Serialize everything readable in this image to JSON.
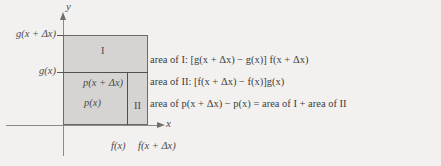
{
  "figure": {
    "background_color": "#f3f1ef",
    "shade_color": "#d6d4d2",
    "line_color": "#6b6b6b"
  },
  "axes": {
    "y_label": "y",
    "x_label": "x"
  },
  "y_ticks": [
    {
      "label": "g(x + Δx)",
      "name": "y-tick-g-x-plus-dx"
    },
    {
      "label": "g(x)",
      "name": "y-tick-g-x"
    }
  ],
  "x_ticks": [
    {
      "label": "f(x)",
      "name": "x-tick-f-x"
    },
    {
      "label": "f(x + Δx)",
      "name": "x-tick-f-x-plus-dx"
    }
  ],
  "regions": {
    "region_one": "I",
    "region_two": "II",
    "p_x_plus_dx": "p(x + Δx)",
    "p_x": "p(x)"
  },
  "equations": [
    {
      "name": "equation-area-of-I",
      "text": "area of I: [g(x + Δx) − g(x)] f(x + Δx)"
    },
    {
      "name": "equation-area-of-II",
      "text": "area of II: [f(x + Δx) − f(x)]g(x)"
    },
    {
      "name": "equation-area-of-p",
      "text": "area of  p(x + Δx)  − p(x) = area of I  + area of II"
    }
  ]
}
